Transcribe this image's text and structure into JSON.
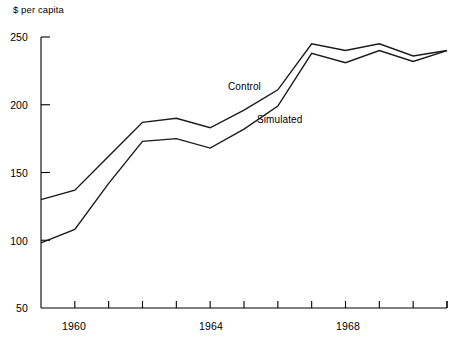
{
  "chart_data": {
    "type": "line",
    "title": "",
    "subtitle": "",
    "ylabel": "$ per capita",
    "xlabel": "",
    "ylim": [
      50,
      250
    ],
    "xlim": [
      1959,
      1971
    ],
    "grid": false,
    "legend_position": "inline-annotations",
    "y_ticks": [
      250,
      200,
      150,
      100,
      50
    ],
    "x_ticks": [
      1959,
      1960,
      1961,
      1962,
      1963,
      1964,
      1965,
      1966,
      1967,
      1968,
      1969,
      1970,
      1971
    ],
    "x_tick_labels_shown": [
      "1960",
      "1964",
      "1968"
    ],
    "x": [
      1959,
      1960,
      1961,
      1962,
      1963,
      1964,
      1965,
      1966,
      1967,
      1968,
      1969,
      1970,
      1971
    ],
    "series": [
      {
        "name": "Control",
        "values": [
          130,
          137,
          162,
          187,
          190,
          183,
          196,
          211,
          245,
          240,
          245,
          236,
          240
        ]
      },
      {
        "name": "Simulated",
        "values": [
          98,
          108,
          142,
          173,
          175,
          168,
          182,
          199,
          238,
          231,
          240,
          232,
          240
        ]
      }
    ],
    "annotations": [
      {
        "text": "Control",
        "x_px": 228,
        "y_px": 81
      },
      {
        "text": "Simulated",
        "x_px": 257,
        "y_px": 114
      }
    ],
    "axis_color": "#000000",
    "line_color": "#1a1a1a"
  },
  "axes": {
    "y_axis_title": "$ per capita",
    "y_labels": [
      {
        "value": "250",
        "y_px": 31
      },
      {
        "value": "200",
        "y_px": 99
      },
      {
        "value": "150",
        "y_px": 167
      },
      {
        "value": "100",
        "y_px": 235
      },
      {
        "value": "50",
        "y_px": 302
      }
    ],
    "x_labels": [
      {
        "value": "1960",
        "x_px": 74
      },
      {
        "value": "1964",
        "x_px": 211
      },
      {
        "value": "1968",
        "x_px": 348
      }
    ]
  }
}
